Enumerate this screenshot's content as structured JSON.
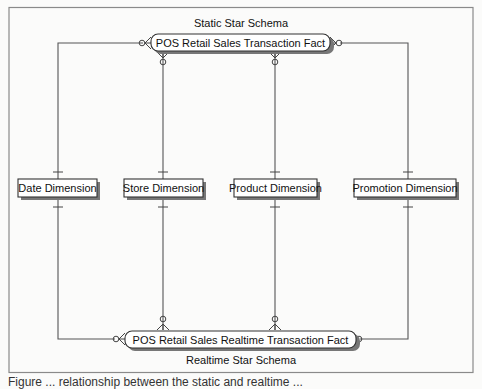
{
  "diagram": {
    "top_schema_label": "Static Star Schema",
    "bottom_schema_label": "Realtime Star Schema",
    "top_fact": {
      "id": "pos-retail-sales-transaction-fact",
      "label": "POS Retail Sales Transaction Fact"
    },
    "bottom_fact": {
      "id": "pos-retail-sales-realtime-transaction-fact",
      "label": "POS Retail Sales Realtime Transaction Fact"
    },
    "dimensions": [
      {
        "id": "date-dimension",
        "label": "Date Dimension"
      },
      {
        "id": "store-dimension",
        "label": "Store Dimension"
      },
      {
        "id": "product-dimension",
        "label": "Product Dimension"
      },
      {
        "id": "promotion-dimension",
        "label": "Promotion Dimension"
      }
    ],
    "relationships": [
      {
        "from": "date-dimension",
        "to": "pos-retail-sales-transaction-fact",
        "dimension_end": "one",
        "fact_end": "zero-or-many"
      },
      {
        "from": "store-dimension",
        "to": "pos-retail-sales-transaction-fact",
        "dimension_end": "one",
        "fact_end": "zero-or-many"
      },
      {
        "from": "product-dimension",
        "to": "pos-retail-sales-transaction-fact",
        "dimension_end": "one",
        "fact_end": "zero-or-many"
      },
      {
        "from": "promotion-dimension",
        "to": "pos-retail-sales-transaction-fact",
        "dimension_end": "one",
        "fact_end": "zero-or-many"
      },
      {
        "from": "date-dimension",
        "to": "pos-retail-sales-realtime-transaction-fact",
        "dimension_end": "one",
        "fact_end": "zero-or-many"
      },
      {
        "from": "store-dimension",
        "to": "pos-retail-sales-realtime-transaction-fact",
        "dimension_end": "one",
        "fact_end": "zero-or-many"
      },
      {
        "from": "product-dimension",
        "to": "pos-retail-sales-realtime-transaction-fact",
        "dimension_end": "one",
        "fact_end": "zero-or-many"
      },
      {
        "from": "promotion-dimension",
        "to": "pos-retail-sales-realtime-transaction-fact",
        "dimension_end": "one",
        "fact_end": "zero-or-many"
      }
    ]
  },
  "caption_partial": "Figure ... relationship between the static and realtime ..."
}
